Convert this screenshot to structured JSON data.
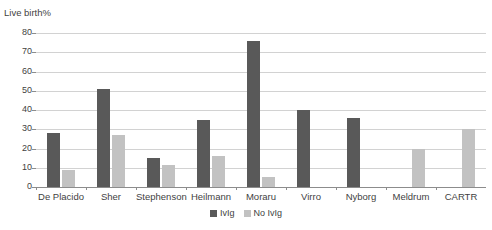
{
  "chart_data": {
    "type": "bar",
    "title": "",
    "ylabel": "Live birth%",
    "xlabel": "",
    "ylim": [
      0,
      80
    ],
    "yticks": [
      0,
      10,
      20,
      30,
      40,
      50,
      60,
      70,
      80
    ],
    "grid": true,
    "legend_position": "bottom",
    "categories": [
      "De Placido",
      "Sher",
      "Stephenson",
      "Heilmann",
      "Moraru",
      "Virro",
      "Nyborg",
      "Meldrum",
      "CARTR"
    ],
    "series": [
      {
        "name": "IvIg",
        "color": "#595959",
        "values": [
          28,
          51,
          15,
          35,
          76,
          40,
          36,
          null,
          null
        ]
      },
      {
        "name": "No IvIg",
        "color": "#c2c2c2",
        "values": [
          9,
          27,
          11.5,
          16,
          5,
          null,
          null,
          20,
          30
        ]
      }
    ]
  },
  "legend": {
    "items": [
      {
        "label": "IvIg",
        "color": "#595959"
      },
      {
        "label": "No IvIg",
        "color": "#c2c2c2"
      }
    ]
  },
  "axis": {
    "y_title": "Live birth%",
    "y_tick_labels": [
      "80",
      "70",
      "60",
      "50",
      "40",
      "30",
      "20",
      "10",
      "0"
    ]
  }
}
